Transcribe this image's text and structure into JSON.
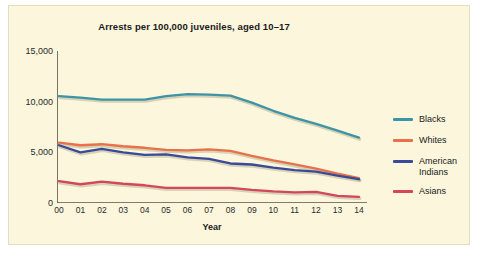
{
  "figure": {
    "background": "#ffffff",
    "panel_background": "#fbf6dc",
    "title": "Arrests per 100,000 juveniles, aged 10–17"
  },
  "chart_data": {
    "type": "line",
    "title": "Arrests per 100,000 juveniles, aged 10–17",
    "xlabel": "Year",
    "ylabel": "",
    "categories": [
      "00",
      "01",
      "02",
      "03",
      "04",
      "05",
      "06",
      "07",
      "08",
      "09",
      "10",
      "11",
      "12",
      "13",
      "14"
    ],
    "x": [
      0,
      1,
      2,
      3,
      4,
      5,
      6,
      7,
      8,
      9,
      10,
      11,
      12,
      13,
      14
    ],
    "ylim": [
      0,
      15000
    ],
    "yticks": [
      0,
      5000,
      10000,
      15000
    ],
    "ytick_labels": [
      "0",
      "5,000",
      "10,000",
      "15,000"
    ],
    "grid": false,
    "legend_position": "right",
    "series": [
      {
        "name": "Blacks",
        "color": "#3f93a6",
        "values": [
          10550,
          10400,
          10200,
          10200,
          10200,
          10550,
          10750,
          10700,
          10600,
          9900,
          9100,
          8400,
          7800,
          7150,
          6450
        ]
      },
      {
        "name": "Whites",
        "color": "#e8714a",
        "values": [
          5950,
          5700,
          5800,
          5600,
          5450,
          5250,
          5200,
          5300,
          5150,
          4650,
          4200,
          3800,
          3400,
          2900,
          2450
        ]
      },
      {
        "name": "American Indians",
        "color": "#3a4a99",
        "values": [
          5700,
          5000,
          5350,
          5000,
          4750,
          4800,
          4500,
          4350,
          3900,
          3800,
          3500,
          3250,
          3100,
          2700,
          2350
        ]
      },
      {
        "name": "Asians",
        "color": "#d4465a",
        "values": [
          2150,
          1850,
          2100,
          1900,
          1750,
          1500,
          1500,
          1500,
          1500,
          1300,
          1150,
          1050,
          1100,
          700,
          600
        ]
      }
    ]
  },
  "legend": {
    "items": [
      {
        "label": "Blacks",
        "color": "#3f93a6"
      },
      {
        "label": "Whites",
        "color": "#e8714a"
      },
      {
        "label": "American Indians",
        "color": "#3a4a99"
      },
      {
        "label": "Asians",
        "color": "#d4465a"
      }
    ]
  }
}
